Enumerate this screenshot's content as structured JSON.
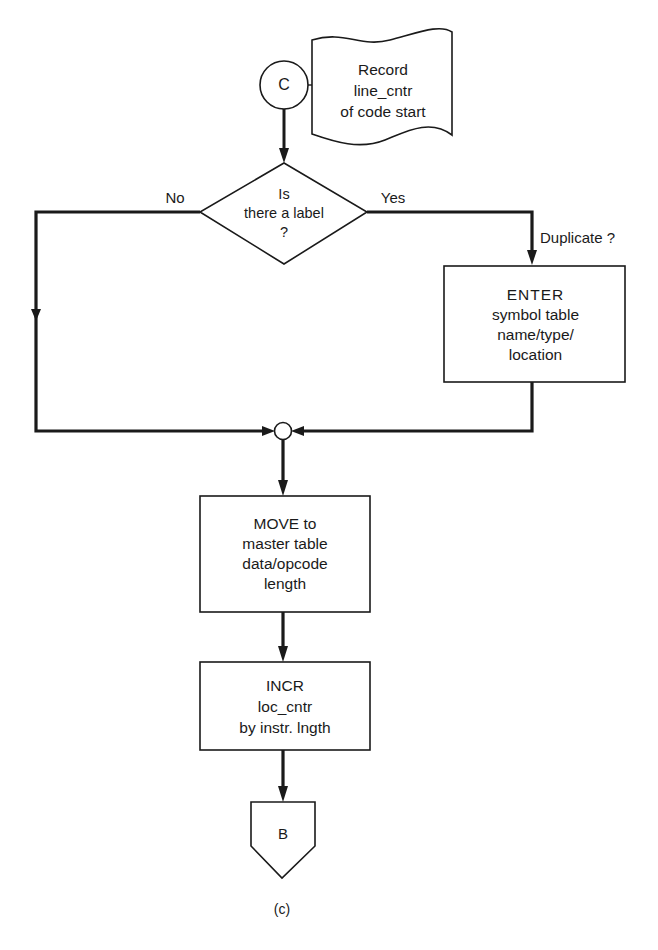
{
  "diagram": {
    "type": "flowchart",
    "caption": "(c)",
    "connector_in": {
      "label": "C"
    },
    "annotation": {
      "lines": [
        "Record",
        "line_cntr",
        "of code start"
      ]
    },
    "decision": {
      "lines": [
        "Is",
        "there a label",
        "?"
      ],
      "no_label": "No",
      "yes_label": "Yes"
    },
    "duplicate_label": "Duplicate ?",
    "enter_box": {
      "lines": [
        "ENTER",
        "symbol table",
        "name/type/",
        "location"
      ]
    },
    "move_box": {
      "lines": [
        "MOVE to",
        "master table",
        "data/opcode",
        "length"
      ]
    },
    "incr_box": {
      "lines": [
        "INCR",
        "loc_cntr",
        "by instr. lngth"
      ]
    },
    "connector_out": {
      "label": "B"
    },
    "colors": {
      "line": "#1a1a1a",
      "background": "#ffffff"
    }
  }
}
